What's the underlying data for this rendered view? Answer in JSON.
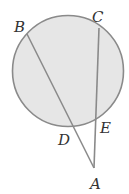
{
  "diagram": {
    "colors": {
      "circle_fill": "#e6e6e6",
      "stroke": "#8a8a8a",
      "label": "#333333",
      "background": "#ffffff"
    },
    "circle": {
      "cx": 68,
      "cy": 71,
      "r": 55.5
    },
    "points": {
      "A": {
        "label": "A",
        "x": 94,
        "y": 168,
        "label_x": 90,
        "label_y": 189
      },
      "B": {
        "label": "B",
        "x": 27,
        "y": 34,
        "label_x": 14,
        "label_y": 32
      },
      "C": {
        "label": "C",
        "x": 99,
        "y": 28,
        "label_x": 92,
        "label_y": 22
      },
      "D": {
        "label": "D",
        "x": 73,
        "y": 126,
        "label_x": 58,
        "label_y": 145
      },
      "E": {
        "label": "E",
        "x": 96,
        "y": 118,
        "label_x": 100,
        "label_y": 133
      }
    },
    "segments": [
      {
        "from": "B",
        "to": "A"
      },
      {
        "from": "C",
        "to": "A"
      }
    ]
  }
}
